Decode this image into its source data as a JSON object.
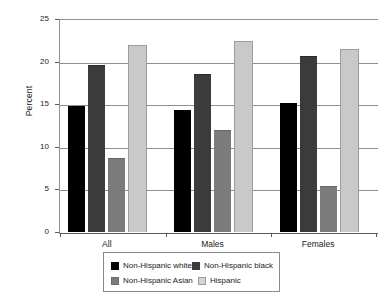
{
  "chart_data": {
    "type": "bar",
    "title": "",
    "subtitle": "",
    "xlabel": "",
    "ylabel": "Percent",
    "ylim": [
      0,
      25
    ],
    "yticks": [
      "0",
      "5",
      "10",
      "15",
      "20",
      "25"
    ],
    "ytick_values": [
      0,
      5,
      10,
      15,
      20,
      25
    ],
    "grid": true,
    "legend_position": "bottom",
    "categories": [
      "All",
      "Males",
      "Females"
    ],
    "series": [
      {
        "name": "Non-Hispanic white",
        "color": "#000000",
        "values": [
          14.8,
          14.3,
          15.1
        ]
      },
      {
        "name": "Non-Hispanic black",
        "color": "#3b3b3b",
        "values": [
          19.5,
          18.4,
          20.6
        ]
      },
      {
        "name": "Non-Hispanic Asian",
        "color": "#7b7b7b",
        "values": [
          8.6,
          11.8,
          5.3
        ]
      },
      {
        "name": "Hispanic",
        "color": "#c9c9c9",
        "values": [
          21.8,
          22.3,
          21.4
        ]
      }
    ]
  },
  "axes": {
    "y_title": "Percent"
  },
  "legend": {
    "items": [
      {
        "label": "Non-Hispanic white",
        "swatch": "swatch-black"
      },
      {
        "label": "Non-Hispanic black",
        "swatch": "swatch-dark"
      },
      {
        "label": "Non-Hispanic Asian",
        "swatch": "swatch-medium"
      },
      {
        "label": "Hispanic",
        "swatch": "swatch-light"
      }
    ]
  }
}
